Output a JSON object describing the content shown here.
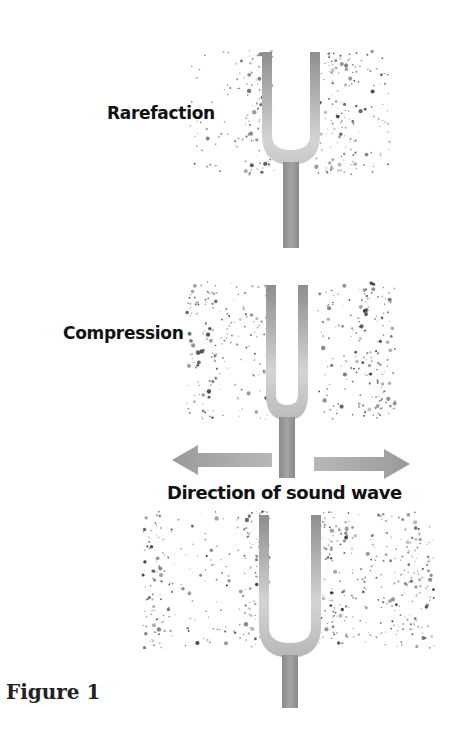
{
  "figure": {
    "caption": "Figure 1",
    "labels": {
      "rarefaction": "Rarefaction",
      "compression": "Compression",
      "direction": "Direction of sound wave"
    },
    "colors": {
      "fork_dark": "#8a8a8a",
      "fork_light": "#d8d8d8",
      "arrow": "#9a9a9a",
      "particle": "#3a3a3a",
      "text": "#111111"
    },
    "panels": [
      {
        "name": "rarefaction-panel",
        "label": "Rarefaction",
        "fork": {
          "cx": 291,
          "prong_top": 52,
          "prong_bottom": 150,
          "stem_bottom": 248,
          "gap": 38
        },
        "region": {
          "x": 190,
          "y": 50,
          "w": 200,
          "h": 125
        },
        "bands": [
          {
            "x": 190,
            "w": 55,
            "density": 0.25
          },
          {
            "x": 245,
            "w": 30,
            "density": 1.0
          },
          {
            "x": 315,
            "w": 40,
            "density": 1.0
          },
          {
            "x": 355,
            "w": 35,
            "density": 0.45
          }
        ]
      },
      {
        "name": "compression-panel",
        "label": "Compression",
        "fork": {
          "cx": 287,
          "prong_top": 285,
          "prong_bottom": 405,
          "stem_bottom": 478,
          "gap": 22
        },
        "region": {
          "x": 187,
          "y": 282,
          "w": 208,
          "h": 137
        },
        "bands": [
          {
            "x": 187,
            "w": 30,
            "density": 1.0
          },
          {
            "x": 217,
            "w": 55,
            "density": 0.5
          },
          {
            "x": 318,
            "w": 40,
            "density": 0.45
          },
          {
            "x": 358,
            "w": 37,
            "density": 1.0
          }
        ]
      },
      {
        "name": "propagation-panel",
        "label": "",
        "fork": {
          "cx": 290,
          "prong_top": 515,
          "prong_bottom": 643,
          "stem_bottom": 708,
          "gap": 42
        },
        "region": {
          "x": 143,
          "y": 511,
          "w": 292,
          "h": 137
        },
        "bands": [
          {
            "x": 143,
            "w": 22,
            "density": 1.0
          },
          {
            "x": 165,
            "w": 78,
            "density": 0.3
          },
          {
            "x": 243,
            "w": 27,
            "density": 1.0
          },
          {
            "x": 318,
            "w": 30,
            "density": 1.0
          },
          {
            "x": 348,
            "w": 52,
            "density": 0.55
          },
          {
            "x": 400,
            "w": 35,
            "density": 0.9
          }
        ]
      }
    ],
    "arrows": {
      "left": {
        "x1": 172,
        "x2": 272,
        "y": 460
      },
      "right": {
        "x1": 314,
        "x2": 410,
        "y": 464
      }
    }
  }
}
